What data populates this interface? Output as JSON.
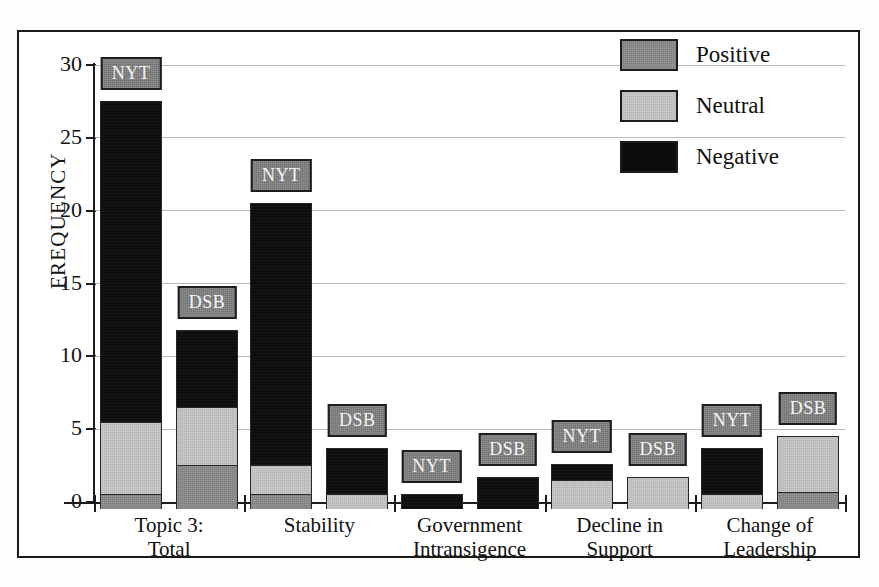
{
  "chart_data": {
    "type": "bar",
    "subtype": "stacked-grouped",
    "title": "",
    "subtitle": "",
    "xlabel": "",
    "ylabel": "FREQUENCY",
    "ylim": [
      0,
      30
    ],
    "ytick_labels": [
      "0",
      "5",
      "10",
      "15",
      "20",
      "25",
      "30"
    ],
    "ytick_values": [
      0,
      5,
      10,
      15,
      20,
      25,
      30
    ],
    "grid": true,
    "grid_axis": "y",
    "legend_position": "top-right",
    "legend": [
      {
        "label": "Positive",
        "color": "#7d7d7d"
      },
      {
        "label": "Neutral",
        "color": "#b5b5b5"
      },
      {
        "label": "Negative",
        "color": "#0d0d0d"
      }
    ],
    "categories": [
      "Topic 3:\nTotal",
      "Stability",
      "Government\nIntransigence",
      "Decline in\nSupport",
      "Change of\nLeadership"
    ],
    "category_lines": [
      [
        "Topic 3:",
        "Total"
      ],
      [
        "Stability"
      ],
      [
        "Government",
        "Intransigence"
      ],
      [
        "Decline in",
        "Support"
      ],
      [
        "Change of",
        "Leadership"
      ]
    ],
    "series_names": [
      "NYT",
      "DSB"
    ],
    "stack_order": [
      "Positive",
      "Neutral",
      "Negative"
    ],
    "series": [
      {
        "name": "Positive",
        "color": "#7d7d7d",
        "NYT": [
          1,
          1,
          0,
          0,
          0
        ],
        "DSB": [
          3,
          0,
          0,
          0,
          1.2
        ]
      },
      {
        "name": "Neutral",
        "color": "#b5b5b5",
        "NYT": [
          5,
          2,
          0,
          2,
          1
        ],
        "DSB": [
          4,
          1,
          0,
          2.2,
          3.8
        ]
      },
      {
        "name": "Negative",
        "color": "#0d0d0d",
        "NYT": [
          22,
          18,
          1,
          1.1,
          3.2
        ],
        "DSB": [
          5.3,
          3.2,
          2.2,
          0,
          0
        ]
      }
    ],
    "totals": {
      "NYT": [
        28,
        21,
        1,
        3.1,
        4.2
      ],
      "DSB": [
        12.3,
        4.2,
        2.2,
        2.2,
        5
      ]
    },
    "bars": [
      {
        "group": "Topic 3: Total",
        "series": "NYT",
        "tag": "NYT",
        "positive": 1,
        "neutral": 5,
        "negative": 22,
        "total": 28
      },
      {
        "group": "Topic 3: Total",
        "series": "DSB",
        "tag": "DSB",
        "positive": 3,
        "neutral": 4,
        "negative": 5.3,
        "total": 12.3
      },
      {
        "group": "Stability",
        "series": "NYT",
        "tag": "NYT",
        "positive": 1,
        "neutral": 2,
        "negative": 18,
        "total": 21
      },
      {
        "group": "Stability",
        "series": "DSB",
        "tag": "DSB",
        "positive": 0,
        "neutral": 1,
        "negative": 3.2,
        "total": 4.2
      },
      {
        "group": "Government Intransigence",
        "series": "NYT",
        "tag": "NYT",
        "positive": 0,
        "neutral": 0,
        "negative": 1,
        "total": 1
      },
      {
        "group": "Government Intransigence",
        "series": "DSB",
        "tag": "DSB",
        "positive": 0,
        "neutral": 0,
        "negative": 2.2,
        "total": 2.2
      },
      {
        "group": "Decline in Support",
        "series": "NYT",
        "tag": "NYT",
        "positive": 0,
        "neutral": 2,
        "negative": 1.1,
        "total": 3.1
      },
      {
        "group": "Decline in Support",
        "series": "DSB",
        "tag": "DSB",
        "positive": 0,
        "neutral": 2.2,
        "negative": 0,
        "total": 2.2
      },
      {
        "group": "Change of Leadership",
        "series": "NYT",
        "tag": "NYT",
        "positive": 0,
        "neutral": 1,
        "negative": 3.2,
        "total": 4.2
      },
      {
        "group": "Change of Leadership",
        "series": "DSB",
        "tag": "DSB",
        "positive": 1.2,
        "neutral": 3.8,
        "negative": 0,
        "total": 5
      }
    ]
  }
}
